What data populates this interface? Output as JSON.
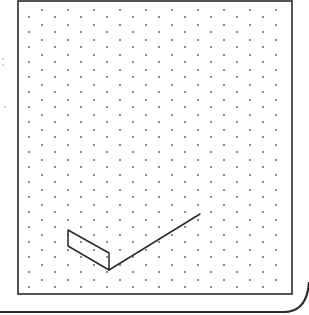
{
  "canvas": {
    "width": 309,
    "height": 315,
    "background": "#ffffff"
  },
  "colors": {
    "frame": "#2a2a2a",
    "dot": "#555555",
    "shape": "#2a2a2a",
    "margin_mark": "#9a9a9a"
  },
  "frame": {
    "inner": {
      "x": 18,
      "y": 1,
      "width": 274,
      "height": 293,
      "stroke_width": 1.6
    },
    "outer_bottom": {
      "y": 312,
      "x_start": 0,
      "corner_x": 284,
      "corner_top_y": 282,
      "right_x": 309,
      "stroke_width": 2.2
    }
  },
  "isometric_dot_grid": {
    "x_start": 29,
    "x_step": 13,
    "columns": 20,
    "y_step": 15,
    "y_start_odd_column": 17,
    "y_start_even_column": 10,
    "y_max": 287,
    "dot_radius": 0.9
  },
  "margin_marks": [
    {
      "x": 3,
      "y": 59
    },
    {
      "x": 3,
      "y": 65
    },
    {
      "x": 5,
      "y": 107
    }
  ],
  "drawing": {
    "parallelogram_face": [
      [
        68,
        230
      ],
      [
        68,
        246
      ],
      [
        109,
        270
      ],
      [
        109,
        253
      ]
    ],
    "line": {
      "from": [
        109,
        270
      ],
      "to": [
        200,
        214
      ]
    },
    "stroke_width": 1.5
  }
}
